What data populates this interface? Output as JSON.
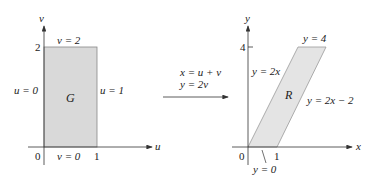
{
  "left_diagram": {
    "axis_x_label": "u",
    "axis_y_label": "v",
    "origin_label": "0",
    "tick_x": "1",
    "tick_y": "2",
    "region_label": "G",
    "boundaries": {
      "top": "v = 2",
      "bottom": "v = 0",
      "left": "u = 0",
      "right": "u = 1"
    },
    "fill_color": "#d9d9d9"
  },
  "transform": {
    "line1": "x = u + v",
    "line2": "y = 2v"
  },
  "right_diagram": {
    "axis_x_label": "x",
    "axis_y_label": "y",
    "origin_label": "0",
    "tick_x": "1",
    "tick_y": "4",
    "region_label": "R",
    "boundaries": {
      "top": "y = 4",
      "bottom": "y = 0",
      "left": "y = 2x",
      "right": "y = 2x − 2"
    },
    "fill_color": "#e4e4e4"
  }
}
